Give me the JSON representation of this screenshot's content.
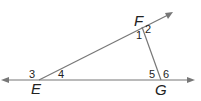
{
  "diagram": {
    "line_color": "#777777",
    "points": {
      "E": {
        "label": "E",
        "x": 39,
        "y": 80
      },
      "F": {
        "label": "F",
        "x": 143,
        "y": 29
      },
      "G": {
        "label": "G",
        "x": 161,
        "y": 80
      }
    },
    "angles": [
      {
        "label": "1",
        "x": 136,
        "y": 40
      },
      {
        "label": "2",
        "x": 145,
        "y": 33
      },
      {
        "label": "3",
        "x": 28,
        "y": 78
      },
      {
        "label": "4",
        "x": 58,
        "y": 78
      },
      {
        "label": "5",
        "x": 149,
        "y": 78
      },
      {
        "label": "6",
        "x": 163,
        "y": 78
      }
    ]
  }
}
